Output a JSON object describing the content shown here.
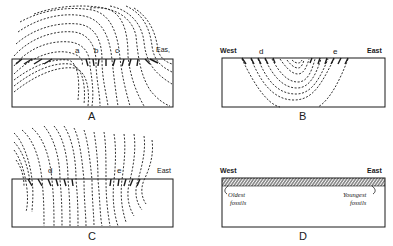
{
  "figure": {
    "panels": [
      {
        "id": "A",
        "letter": "A",
        "labels": {
          "a": "a",
          "b": "b",
          "c": "c",
          "east": "Eas,"
        }
      },
      {
        "id": "B",
        "letter": "B",
        "labels": {
          "west": "West",
          "d": "d",
          "e": "e",
          "east": "East"
        }
      },
      {
        "id": "C",
        "letter": "C",
        "labels": {
          "d": "d",
          "e": "e",
          "east": "East"
        }
      },
      {
        "id": "D",
        "letter": "D",
        "labels": {
          "west": "West",
          "east": "East",
          "oldest_line1": "Oldest",
          "oldest_line2": "fossils",
          "youngest_line1": "Youngest",
          "youngest_line2": "fossils"
        }
      }
    ],
    "colors": {
      "ink": "#1a1a1a",
      "background": "#ffffff"
    }
  }
}
